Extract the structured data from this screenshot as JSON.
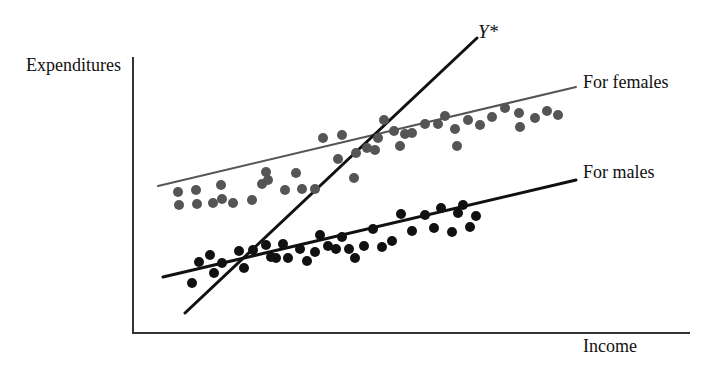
{
  "figure": {
    "axis_y_label": "Expenditures",
    "axis_x_label": "Income",
    "annotations": {
      "ystar": "Y*",
      "females": "For females",
      "males": "For males"
    }
  },
  "chart_data": {
    "type": "scatter",
    "title": "",
    "xlabel": "Income",
    "ylabel": "Expenditures",
    "grid": false,
    "legend_position": "right-inline",
    "axis": {
      "origin": [
        133,
        333
      ],
      "y_top": [
        133,
        57
      ],
      "x_right": [
        690,
        333
      ],
      "xlim": [
        133,
        690
      ],
      "ylim": [
        333,
        57
      ],
      "ticks": false,
      "tick_labels": []
    },
    "colors": {
      "females": "#555555",
      "males": "#111111",
      "pooled": "#111111",
      "axis": "#333333",
      "background": "#ffffff"
    },
    "series": [
      {
        "name": "For females",
        "color": "#555555",
        "marker": "circle",
        "marker_radius": 5,
        "points": [
          [
            178,
            192
          ],
          [
            179,
            205
          ],
          [
            196,
            190
          ],
          [
            197,
            204
          ],
          [
            213,
            203
          ],
          [
            221,
            185
          ],
          [
            222,
            199
          ],
          [
            233,
            203
          ],
          [
            252,
            200
          ],
          [
            262,
            184
          ],
          [
            266,
            172
          ],
          [
            268,
            180
          ],
          [
            285,
            190
          ],
          [
            296,
            173
          ],
          [
            302,
            189
          ],
          [
            315,
            189
          ],
          [
            323,
            138
          ],
          [
            338,
            159
          ],
          [
            342,
            135
          ],
          [
            354,
            178
          ],
          [
            356,
            153
          ],
          [
            367,
            148
          ],
          [
            375,
            150
          ],
          [
            378,
            138
          ],
          [
            384,
            120
          ],
          [
            394,
            131
          ],
          [
            400,
            146
          ],
          [
            405,
            134
          ],
          [
            412,
            133
          ],
          [
            425,
            124
          ],
          [
            438,
            124
          ],
          [
            445,
            116
          ],
          [
            455,
            129
          ],
          [
            457,
            146
          ],
          [
            468,
            120
          ],
          [
            480,
            125
          ],
          [
            492,
            117
          ],
          [
            505,
            108
          ],
          [
            519,
            113
          ],
          [
            520,
            127
          ],
          [
            535,
            118
          ],
          [
            547,
            111
          ],
          [
            558,
            115
          ]
        ]
      },
      {
        "name": "For males",
        "color": "#111111",
        "marker": "circle",
        "marker_radius": 5,
        "points": [
          [
            192,
            283
          ],
          [
            199,
            262
          ],
          [
            210,
            255
          ],
          [
            214,
            273
          ],
          [
            222,
            263
          ],
          [
            239,
            251
          ],
          [
            244,
            268
          ],
          [
            253,
            250
          ],
          [
            266,
            245
          ],
          [
            271,
            257
          ],
          [
            276,
            258
          ],
          [
            283,
            244
          ],
          [
            288,
            258
          ],
          [
            300,
            249
          ],
          [
            307,
            261
          ],
          [
            315,
            252
          ],
          [
            320,
            235
          ],
          [
            328,
            246
          ],
          [
            336,
            249
          ],
          [
            342,
            237
          ],
          [
            349,
            249
          ],
          [
            355,
            258
          ],
          [
            364,
            246
          ],
          [
            373,
            229
          ],
          [
            382,
            247
          ],
          [
            392,
            241
          ],
          [
            401,
            214
          ],
          [
            412,
            231
          ],
          [
            425,
            215
          ],
          [
            434,
            228
          ],
          [
            441,
            208
          ],
          [
            452,
            232
          ],
          [
            458,
            213
          ],
          [
            463,
            205
          ],
          [
            470,
            227
          ],
          [
            476,
            216
          ]
        ]
      }
    ],
    "lines": [
      {
        "name": "female-regression",
        "label": "For females",
        "color": "#555555",
        "width": 2,
        "from": [
          158,
          186
        ],
        "to": [
          576,
          87
        ]
      },
      {
        "name": "male-regression",
        "label": "For males",
        "color": "#111111",
        "width": 3,
        "from": [
          163,
          277
        ],
        "to": [
          576,
          180
        ]
      },
      {
        "name": "pooled-regression",
        "label": "Y*",
        "color": "#111111",
        "width": 3,
        "from": [
          185,
          313
        ],
        "to": [
          477,
          38
        ]
      }
    ]
  }
}
